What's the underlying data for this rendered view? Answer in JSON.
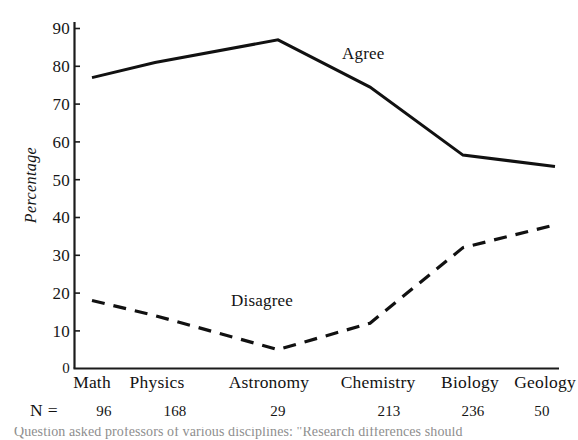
{
  "chart_data": {
    "type": "line",
    "title": "",
    "xlabel": "",
    "ylabel": "Percentage",
    "ylim": [
      0,
      90
    ],
    "yticks": [
      0,
      10,
      20,
      30,
      40,
      50,
      60,
      70,
      80,
      90
    ],
    "ytick_labels": [
      "0",
      "10",
      "20",
      "30",
      "40",
      "50",
      "60",
      "70",
      "80",
      "90"
    ],
    "grid": false,
    "legend_position": "inline-annotation",
    "categories": [
      "Math",
      "Physics",
      "Astronomy",
      "Chemistry",
      "Biology",
      "Geology"
    ],
    "series": [
      {
        "name": "Agree",
        "style": "solid",
        "color": "#111111",
        "values": [
          77,
          81,
          87,
          74.5,
          56.5,
          53.5
        ]
      },
      {
        "name": "Disagree",
        "style": "dashed",
        "color": "#111111",
        "values": [
          18,
          14,
          5,
          12,
          32,
          38
        ]
      }
    ],
    "annotations": [
      {
        "text": "Agree",
        "series": "Agree"
      },
      {
        "text": "Disagree",
        "series": "Disagree"
      }
    ],
    "sample_sizes": {
      "label": "N =",
      "values": [
        "96",
        "168",
        "29",
        "213",
        "236",
        "50"
      ]
    }
  },
  "axis": {
    "y_title": "Percentage"
  },
  "caption": {
    "text": "Question asked professors of various disciplines: \"Research differences should"
  }
}
